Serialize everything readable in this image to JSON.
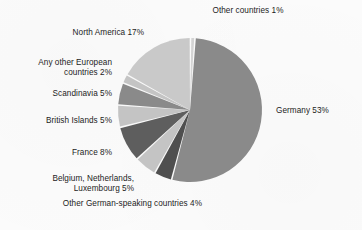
{
  "chart_data": {
    "type": "pie",
    "title": "",
    "subtitle": "",
    "xlabel": "",
    "ylabel": "",
    "legend_position": "none",
    "grid": false,
    "units": "percent",
    "total": 100,
    "start_angle_deg": 4,
    "direction": "clockwise",
    "categories": [
      "Germany",
      "Other German-speaking countries",
      "Belgium, Netherlands, Luxembourg",
      "France",
      "British Islands",
      "Scandinavia",
      "Any other European countries",
      "North America",
      "Other countries"
    ],
    "values": [
      53,
      4,
      5,
      8,
      5,
      5,
      2,
      17,
      1
    ],
    "slices": [
      {
        "name": "Germany",
        "value": 53,
        "label": "Germany 53%",
        "color": "#8a8a8a",
        "label_side": "right"
      },
      {
        "name": "Other German-speaking countries",
        "value": 4,
        "label": "Other German-speaking countries 4%",
        "color": "#4f4f4f",
        "label_side": "bottom"
      },
      {
        "name": "Belgium, Netherlands, Luxembourg",
        "value": 5,
        "label": "Belgium, Netherlands,\nLuxembourg 5%",
        "color": "#c4c4c4",
        "label_side": "left"
      },
      {
        "name": "France",
        "value": 8,
        "label": "France 8%",
        "color": "#5e5e5e",
        "label_side": "left"
      },
      {
        "name": "British Islands",
        "value": 5,
        "label": "British Islands 5%",
        "color": "#c4c4c4",
        "label_side": "left"
      },
      {
        "name": "Scandinavia",
        "value": 5,
        "label": "Scandinavia 5%",
        "color": "#8a8a8a",
        "label_side": "left"
      },
      {
        "name": "Any other European countries",
        "value": 2,
        "label": "Any other European\ncountries 2%",
        "color": "#c4c4c4",
        "label_side": "left"
      },
      {
        "name": "North America",
        "value": 17,
        "label": "North America 17%",
        "color": "#c9c9c9",
        "label_side": "left"
      },
      {
        "name": "Other countries",
        "value": 1,
        "label": "Other countries 1%",
        "color": "#d4d4d4",
        "label_side": "top"
      }
    ],
    "colors": {
      "background": "#fbfbfb",
      "slice_gap": "#ffffff",
      "text": "#1c1c1c"
    }
  }
}
